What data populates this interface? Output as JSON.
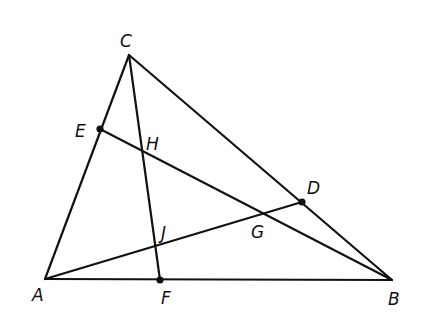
{
  "diagram": {
    "type": "triangle-cevians",
    "stroke_color": "#111111",
    "background": "#ffffff",
    "points": {
      "A": {
        "label": "A",
        "x": 45,
        "y": 279,
        "lx": 32,
        "ly": 301,
        "dot": false
      },
      "B": {
        "label": "B",
        "x": 392,
        "y": 280,
        "lx": 388,
        "ly": 305,
        "dot": false
      },
      "C": {
        "label": "C",
        "x": 129,
        "y": 55,
        "lx": 120,
        "ly": 47,
        "dot": false
      },
      "D": {
        "label": "D",
        "x": 302,
        "y": 202,
        "lx": 307,
        "ly": 194,
        "dot": true
      },
      "E": {
        "label": "E",
        "x": 100,
        "y": 129,
        "lx": 75,
        "ly": 137,
        "dot": true
      },
      "F": {
        "label": "F",
        "x": 160,
        "y": 280,
        "lx": 161,
        "ly": 304,
        "dot": true
      },
      "G": {
        "label": "G",
        "x": 263,
        "y": 214,
        "lx": 251,
        "ly": 238,
        "dot": false
      },
      "H": {
        "label": "H",
        "x": 143,
        "y": 152,
        "lx": 146,
        "ly": 150,
        "dot": false
      },
      "J": {
        "label": "J",
        "x": 157,
        "y": 245,
        "lx": 161,
        "ly": 239,
        "dot": false
      }
    },
    "segments": [
      {
        "name": "side-AB",
        "from": "A",
        "to": "B"
      },
      {
        "name": "side-BC",
        "from": "B",
        "to": "C"
      },
      {
        "name": "side-CA",
        "from": "C",
        "to": "A"
      },
      {
        "name": "cevian-CF",
        "from": "C",
        "to": "F"
      },
      {
        "name": "cevian-EB",
        "from": "E",
        "to": "B"
      },
      {
        "name": "cevian-AD",
        "from": "A",
        "to": "D"
      }
    ]
  }
}
